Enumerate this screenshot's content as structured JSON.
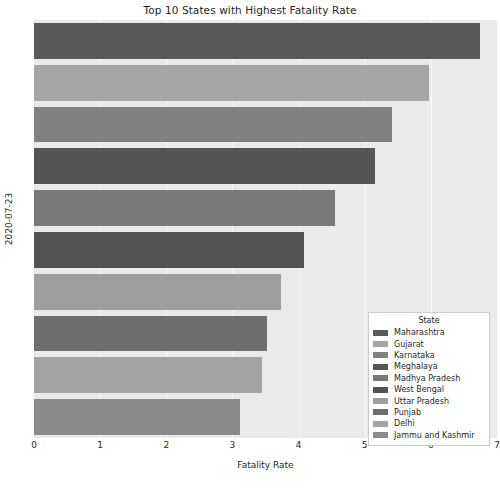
{
  "chart_data": {
    "type": "bar",
    "orientation": "horizontal",
    "title": "Top 10 States with Highest Fatality Rate",
    "xlabel": "Fatality Rate",
    "ylabel": "2020-07-23",
    "categories": [
      "Maharashtra",
      "Gujarat",
      "Karnataka",
      "Meghalaya",
      "Madhya Pradesh",
      "West Bengal",
      "Uttar Pradesh",
      "Punjab",
      "Delhi",
      "Jammu and Kashmir"
    ],
    "values": [
      6.75,
      5.97,
      5.42,
      5.15,
      4.55,
      4.08,
      3.73,
      3.53,
      3.45,
      3.12
    ],
    "colors": [
      "#595959",
      "#a6a6a6",
      "#808080",
      "#555555",
      "#787878",
      "#525252",
      "#9e9e9e",
      "#6e6e6e",
      "#a3a3a3",
      "#8a8a8a"
    ],
    "xlim": [
      0,
      7
    ],
    "xticks": [
      0,
      1,
      2,
      3,
      4,
      5,
      6,
      7
    ],
    "xticklabels": [
      "0",
      "1",
      "2",
      "3",
      "4",
      "5",
      "6",
      "7"
    ],
    "grid": true,
    "grid_color": "#f7f7f7",
    "plot_background": "#eaeaea",
    "legend": {
      "title": "State",
      "position": "lower right",
      "entries": [
        "Maharashtra",
        "Gujarat",
        "Karnataka",
        "Meghalaya",
        "Madhya Pradesh",
        "West Bengal",
        "Uttar Pradesh",
        "Punjab",
        "Delhi",
        "Jammu and Kashmir"
      ]
    }
  },
  "bottom_caption": ""
}
